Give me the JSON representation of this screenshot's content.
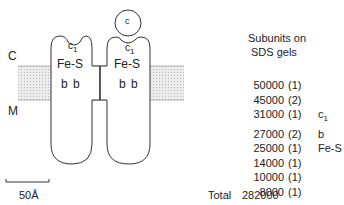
{
  "diagram": {
    "labels": {
      "cytoplasm_side": "C",
      "matrix_side": "M",
      "scale_bar": "50Å",
      "cytochrome_c": "c"
    },
    "left_monomer": {
      "c1": "c",
      "c1_sub": "1",
      "fes": "Fe-S",
      "b": "b b"
    },
    "right_monomer": {
      "c1": "c",
      "c1_sub": "1",
      "fes": "Fe-S",
      "b": "b b"
    }
  },
  "subunits": {
    "title_line1": "Subunits on",
    "title_line2": "SDS gels",
    "rows": [
      {
        "mw": "50000",
        "count": "(1)",
        "label": "",
        "label_sub": ""
      },
      {
        "mw": "45000",
        "count": "(2)",
        "label": "",
        "label_sub": ""
      },
      {
        "mw": "31000",
        "count": "(1)",
        "label": "c",
        "label_sub": "1"
      },
      {
        "mw": "27000",
        "count": "(2)",
        "label": "b",
        "label_sub": ""
      },
      {
        "mw": "25000",
        "count": "(1)",
        "label": "Fe-S",
        "label_sub": ""
      },
      {
        "mw": "14000",
        "count": "(1)",
        "label": "",
        "label_sub": ""
      },
      {
        "mw": "10000",
        "count": "(1)",
        "label": "",
        "label_sub": ""
      },
      {
        "mw": "8000",
        "count": "(1)",
        "label": "",
        "label_sub": ""
      }
    ],
    "total_label": "Total",
    "total_value": "282000"
  }
}
